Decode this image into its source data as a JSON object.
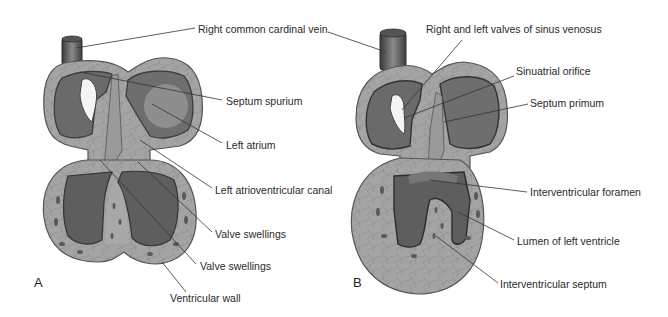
{
  "figure": {
    "panels": [
      {
        "id": "A",
        "letter": "A",
        "labels": [
          "Right common cardinal vein",
          "Septum spurium",
          "Left atrium",
          "Left atrioventricular canal",
          "Valve swellings",
          "Valve swellings",
          "Ventricular wall"
        ]
      },
      {
        "id": "B",
        "letter": "B",
        "labels": [
          "Right and left valves of sinus venosus",
          "Sinuatrial orifice",
          "Septum primum",
          "Interventricular foramen",
          "Lumen of left ventricle",
          "Interventricular septum"
        ]
      }
    ],
    "colors": {
      "outer_wall": "#9a9a9a",
      "wall_outline": "#4a4a4a",
      "atrium_dark": "#6e6e6e",
      "atrium_light": "#8c8c8c",
      "lumen": "#5c5c5c",
      "tissue": "#a9a9a9",
      "valve_highlight": "#f2f2f2",
      "leader": "#333333"
    }
  }
}
